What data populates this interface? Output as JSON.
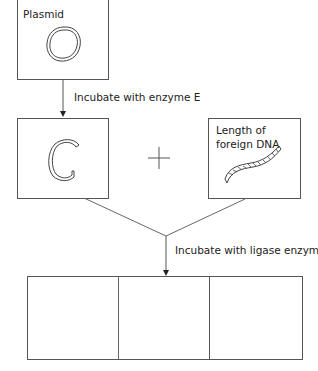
{
  "diagram": {
    "type": "flow",
    "plasmid_box": {
      "label": "Plasmid"
    },
    "step1": {
      "label": "Incubate with enzyme E"
    },
    "cut_plasmid_box": {
      "label": ""
    },
    "operator": "+",
    "foreign_dna_box": {
      "label_line1": "Length of",
      "label_line2": "foreign DNA"
    },
    "step2": {
      "label": "Incubate with ligase enzyme"
    },
    "result_boxes": [
      {
        "label": ""
      },
      {
        "label": ""
      },
      {
        "label": ""
      }
    ],
    "colors": {
      "line": "#555555",
      "text": "#222222",
      "background": "#ffffff"
    }
  }
}
